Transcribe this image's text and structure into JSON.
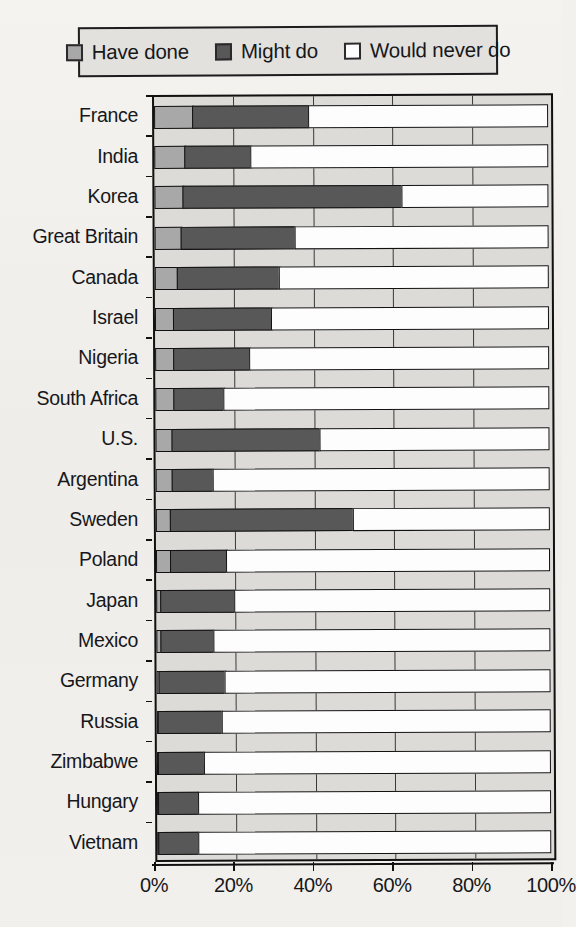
{
  "legend": {
    "items": [
      {
        "label": "Have done",
        "color": "#a8a8a8",
        "key": "have_done"
      },
      {
        "label": "Might do",
        "color": "#585858",
        "key": "might_do"
      },
      {
        "label": "Would never do",
        "color": "#fdfdfd",
        "key": "would_never_do"
      }
    ]
  },
  "axis": {
    "x_ticks": [
      "0%",
      "20%",
      "40%",
      "60%",
      "80%",
      "100%"
    ],
    "x_tick_values": [
      0,
      20,
      40,
      60,
      80,
      100
    ]
  },
  "chart_data": {
    "type": "bar",
    "orientation": "horizontal",
    "stacked": true,
    "title": "",
    "xlabel": "",
    "ylabel": "",
    "xlim": [
      0,
      100
    ],
    "grid": true,
    "legend_position": "top",
    "categories": [
      "France",
      "India",
      "Korea",
      "Great Britain",
      "Canada",
      "Israel",
      "Nigeria",
      "South Africa",
      "U.S.",
      "Argentina",
      "Sweden",
      "Poland",
      "Japan",
      "Mexico",
      "Germany",
      "Russia",
      "Zimbabwe",
      "Hungary",
      "Vietnam"
    ],
    "series": [
      {
        "name": "Have done",
        "color": "#a8a8a8",
        "values": [
          10,
          8,
          7.5,
          7,
          6,
          5,
          5,
          5,
          4.5,
          4.5,
          4,
          4,
          1.5,
          1.5,
          1,
          0.5,
          0.5,
          0.5,
          0.5
        ]
      },
      {
        "name": "Might do",
        "color": "#585858",
        "values": [
          29.5,
          17,
          55.5,
          29,
          26,
          25,
          19.5,
          13,
          37.5,
          10.5,
          46.5,
          14.5,
          19,
          13.5,
          17,
          16.5,
          12,
          10.5,
          10.5
        ]
      },
      {
        "name": "Would never do",
        "color": "#fdfdfd",
        "values": [
          60.5,
          75,
          37,
          64,
          68,
          70,
          75.5,
          82,
          58,
          85,
          49.5,
          81.5,
          79.5,
          85,
          82,
          83,
          87.5,
          89,
          89
        ]
      }
    ]
  }
}
